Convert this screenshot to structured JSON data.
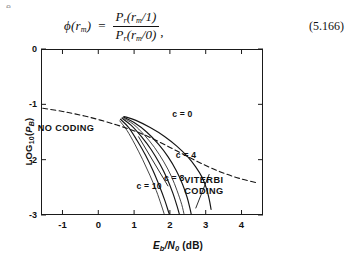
{
  "artifact": {
    "text": "e"
  },
  "equation": {
    "lhs_phi": "ϕ",
    "lhs_arg_open": "(",
    "lhs_var": "r",
    "lhs_sub": "m",
    "lhs_arg_close": ")",
    "equals": "=",
    "numerator_main": "P",
    "numerator_sub": "r",
    "numerator_arg": "(r",
    "numerator_arg_sub": "m",
    "numerator_arg_tail": "/1)",
    "denominator_main": "P",
    "denominator_sub": "r",
    "denominator_arg": "(r",
    "denominator_arg_sub": "m",
    "denominator_arg_tail": "/0)",
    "trailing_comma": ",",
    "number": "(5.166)"
  },
  "chart_data": {
    "type": "line",
    "title": "",
    "xlabel": "Eb/N0 (dB)",
    "xlabel_main": "E",
    "xlabel_main_sub": "b",
    "xlabel_slash": "/N",
    "xlabel_den_sub": "0",
    "xlabel_units": " (dB)",
    "ylabel": "LOG10(PB)",
    "ylabel_main": "LOG",
    "ylabel_main_sub": "10",
    "ylabel_arg_open": "(",
    "ylabel_arg": "P",
    "ylabel_arg_sub": "B",
    "ylabel_arg_close": ")",
    "xlim": [
      -1.6,
      4.6
    ],
    "ylim": [
      -3,
      0
    ],
    "xticks": [
      -1,
      0,
      1,
      2,
      3,
      4
    ],
    "xtick_labels": [
      "-1",
      "0",
      "1",
      "2",
      "3",
      "4"
    ],
    "yticks": [
      0,
      -1,
      -2,
      -3
    ],
    "ytick_labels": [
      "0",
      "-1",
      "-2",
      "-3"
    ],
    "grid": false,
    "legend": "none",
    "annotations": [
      {
        "name": "no-coding",
        "text": "NO CODING",
        "x": -0.9,
        "y": -1.42
      },
      {
        "name": "c-0",
        "text": "c = 0",
        "x": 2.35,
        "y": -1.18
      },
      {
        "name": "c-4",
        "text": "c = 4",
        "x": 2.45,
        "y": -1.92
      },
      {
        "name": "c-8",
        "text": "c = 8",
        "x": 2.12,
        "y": -2.33
      },
      {
        "name": "c-10",
        "text": "c = 10",
        "x": 1.42,
        "y": -2.48
      },
      {
        "name": "viterbi-coding",
        "text": "VITERBI CODING",
        "line1": "VITERBI",
        "line2": "CODING",
        "x": 2.95,
        "y": -2.48
      }
    ],
    "series": [
      {
        "name": "NO CODING",
        "style": "dashed",
        "points": [
          [
            -1.55,
            -1.07
          ],
          [
            -0.9,
            -1.14
          ],
          [
            -0.2,
            -1.24
          ],
          [
            0.5,
            -1.37
          ],
          [
            1.05,
            -1.49
          ],
          [
            1.45,
            -1.6
          ],
          [
            1.95,
            -1.76
          ],
          [
            2.45,
            -1.93
          ],
          [
            2.95,
            -2.09
          ],
          [
            3.45,
            -2.23
          ],
          [
            3.95,
            -2.34
          ],
          [
            4.45,
            -2.42
          ]
        ]
      },
      {
        "name": "c = 0",
        "style": "solid",
        "points": [
          [
            0.72,
            -1.22
          ],
          [
            1.05,
            -1.29
          ],
          [
            1.45,
            -1.42
          ],
          [
            1.85,
            -1.58
          ],
          [
            2.2,
            -1.76
          ],
          [
            2.5,
            -1.95
          ],
          [
            2.72,
            -2.13
          ],
          [
            2.9,
            -2.32
          ],
          [
            3.02,
            -2.52
          ],
          [
            3.1,
            -2.72
          ],
          [
            3.15,
            -2.9
          ]
        ]
      },
      {
        "name": "c = 4",
        "style": "solid",
        "points": [
          [
            0.7,
            -1.23
          ],
          [
            1.0,
            -1.33
          ],
          [
            1.35,
            -1.5
          ],
          [
            1.68,
            -1.72
          ],
          [
            1.95,
            -1.95
          ],
          [
            2.18,
            -2.2
          ],
          [
            2.35,
            -2.44
          ],
          [
            2.48,
            -2.68
          ],
          [
            2.56,
            -2.88
          ],
          [
            2.6,
            -3.0
          ]
        ]
      },
      {
        "name": "c = 8",
        "style": "solid",
        "points": [
          [
            0.66,
            -1.25
          ],
          [
            0.92,
            -1.38
          ],
          [
            1.2,
            -1.58
          ],
          [
            1.48,
            -1.82
          ],
          [
            1.72,
            -2.08
          ],
          [
            1.92,
            -2.34
          ],
          [
            2.08,
            -2.6
          ],
          [
            2.2,
            -2.84
          ],
          [
            2.27,
            -3.0
          ]
        ]
      },
      {
        "name": "c = 10",
        "style": "solid",
        "points": [
          [
            0.62,
            -1.27
          ],
          [
            0.85,
            -1.42
          ],
          [
            1.08,
            -1.65
          ],
          [
            1.32,
            -1.92
          ],
          [
            1.53,
            -2.2
          ],
          [
            1.71,
            -2.48
          ],
          [
            1.86,
            -2.74
          ],
          [
            1.97,
            -2.96
          ],
          [
            2.0,
            -3.0
          ]
        ]
      },
      {
        "name": "c = 8 shadow",
        "style": "solid-thin",
        "points": [
          [
            0.68,
            -1.24
          ],
          [
            0.98,
            -1.36
          ],
          [
            1.28,
            -1.55
          ],
          [
            1.57,
            -1.78
          ],
          [
            1.83,
            -2.04
          ],
          [
            2.04,
            -2.3
          ],
          [
            2.2,
            -2.56
          ],
          [
            2.33,
            -2.81
          ],
          [
            2.4,
            -3.0
          ]
        ]
      },
      {
        "name": "c = 10 shadow",
        "style": "solid-thin",
        "points": [
          [
            0.6,
            -1.3
          ],
          [
            0.8,
            -1.47
          ],
          [
            1.02,
            -1.72
          ],
          [
            1.24,
            -2.0
          ],
          [
            1.44,
            -2.28
          ],
          [
            1.62,
            -2.56
          ],
          [
            1.76,
            -2.82
          ],
          [
            1.85,
            -3.0
          ]
        ]
      }
    ],
    "pointer_lines": [
      {
        "name": "c8-pointer",
        "from": [
          1.12,
          -1.58
        ],
        "to": [
          1.95,
          -2.48
        ]
      },
      {
        "name": "viterbi-pointer",
        "from": [
          3.1,
          -2.26
        ],
        "to": [
          2.72,
          -2.88
        ]
      }
    ]
  }
}
